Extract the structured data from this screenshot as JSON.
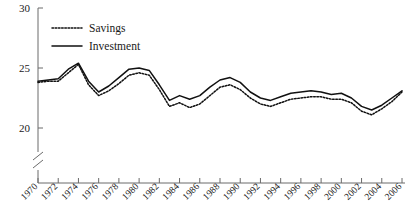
{
  "chart_data": {
    "type": "line",
    "title": "",
    "xlabel": "",
    "ylabel": "",
    "xlim": [
      1970,
      2006
    ],
    "ylim": [
      19,
      30
    ],
    "yticks": [
      20,
      25,
      30
    ],
    "grid": false,
    "axis_break": true,
    "legend_position": "top-left",
    "x": [
      1970,
      1971,
      1972,
      1973,
      1974,
      1975,
      1976,
      1977,
      1978,
      1979,
      1980,
      1981,
      1982,
      1983,
      1984,
      1985,
      1986,
      1987,
      1988,
      1989,
      1990,
      1991,
      1992,
      1993,
      1994,
      1995,
      1996,
      1997,
      1998,
      1999,
      2000,
      2001,
      2002,
      2003,
      2004,
      2005,
      2006
    ],
    "xtick_labels": [
      "1970",
      "1972",
      "1974",
      "1976",
      "1978",
      "1980",
      "1982",
      "1984",
      "1986",
      "1988",
      "1990",
      "1992",
      "1994",
      "1996",
      "1998",
      "2000",
      "2002",
      "2004",
      "2006"
    ],
    "series": [
      {
        "name": "Savings",
        "style": "dotted",
        "values": [
          23.8,
          23.9,
          23.9,
          24.6,
          25.3,
          23.6,
          22.7,
          23.1,
          23.7,
          24.4,
          24.6,
          24.4,
          23.2,
          21.8,
          22.1,
          21.7,
          22.0,
          22.7,
          23.4,
          23.6,
          23.2,
          22.5,
          22.0,
          21.8,
          22.1,
          22.4,
          22.5,
          22.6,
          22.6,
          22.4,
          22.4,
          22.1,
          21.4,
          21.1,
          21.6,
          22.2,
          23.0
        ]
      },
      {
        "name": "Investment",
        "style": "solid",
        "values": [
          23.9,
          24.0,
          24.1,
          24.9,
          25.4,
          23.9,
          23.0,
          23.5,
          24.2,
          24.9,
          25.0,
          24.8,
          23.6,
          22.3,
          22.7,
          22.4,
          22.7,
          23.4,
          24.0,
          24.2,
          23.8,
          23.0,
          22.5,
          22.3,
          22.6,
          22.9,
          23.0,
          23.1,
          23.0,
          22.8,
          22.9,
          22.5,
          21.8,
          21.5,
          21.9,
          22.5,
          23.1
        ]
      }
    ]
  },
  "legend": {
    "items": [
      {
        "label": "Savings"
      },
      {
        "label": "Investment"
      }
    ]
  },
  "colors": {
    "line": "#111111",
    "axis": "#6b6b6b",
    "background": "#ffffff"
  }
}
